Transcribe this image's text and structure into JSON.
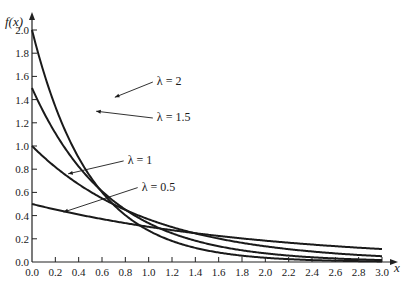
{
  "chart_data": {
    "type": "line",
    "title": "",
    "xlabel": "x",
    "ylabel": "f(x)",
    "xlim": [
      0.0,
      3.0
    ],
    "ylim": [
      0.0,
      2.0
    ],
    "grid": false,
    "legend_position": "inline-annotations",
    "x_ticks": [
      "0.0",
      "0.2",
      "0.4",
      "0.6",
      "0.8",
      "1.0",
      "1.2",
      "1.4",
      "1.6",
      "1.8",
      "2.0",
      "2.2",
      "2.4",
      "2.6",
      "2.8",
      "3.0"
    ],
    "y_ticks": [
      "0.0",
      "0.2",
      "0.4",
      "0.6",
      "0.8",
      "1.0",
      "1.2",
      "1.4",
      "1.6",
      "1.8",
      "2.0"
    ],
    "function": "f(x) = λ·e^(−λx)",
    "series": [
      {
        "name": "λ = 2",
        "lambda": 2.0,
        "x": [
          0,
          0.2,
          0.4,
          0.6,
          0.8,
          1.0,
          1.2,
          1.4,
          1.6,
          1.8,
          2.0,
          2.2,
          2.4,
          2.6,
          2.8,
          3.0
        ],
        "values": [
          2.0,
          1.341,
          0.899,
          0.602,
          0.404,
          0.271,
          0.181,
          0.122,
          0.082,
          0.055,
          0.037,
          0.025,
          0.016,
          0.011,
          0.007,
          0.005
        ],
        "label_pos": [
          0.71,
          1.42
        ],
        "label_text_pos": [
          1.07,
          1.56
        ]
      },
      {
        "name": "λ = 1.5",
        "lambda": 1.5,
        "x": [
          0,
          0.2,
          0.4,
          0.6,
          0.8,
          1.0,
          1.2,
          1.4,
          1.6,
          1.8,
          2.0,
          2.2,
          2.4,
          2.6,
          2.8,
          3.0
        ],
        "values": [
          1.5,
          1.111,
          0.823,
          0.61,
          0.452,
          0.335,
          0.248,
          0.184,
          0.136,
          0.101,
          0.075,
          0.055,
          0.041,
          0.03,
          0.022,
          0.017
        ],
        "label_pos": [
          0.55,
          1.3
        ],
        "label_text_pos": [
          1.07,
          1.25
        ]
      },
      {
        "name": "λ = 1",
        "lambda": 1.0,
        "x": [
          0,
          0.2,
          0.4,
          0.6,
          0.8,
          1.0,
          1.2,
          1.4,
          1.6,
          1.8,
          2.0,
          2.2,
          2.4,
          2.6,
          2.8,
          3.0
        ],
        "values": [
          1.0,
          0.819,
          0.67,
          0.549,
          0.449,
          0.368,
          0.301,
          0.247,
          0.202,
          0.165,
          0.135,
          0.111,
          0.091,
          0.074,
          0.061,
          0.05
        ],
        "label_pos": [
          0.31,
          0.76
        ],
        "label_text_pos": [
          0.82,
          0.88
        ]
      },
      {
        "name": "λ = 0.5",
        "lambda": 0.5,
        "x": [
          0,
          0.2,
          0.4,
          0.6,
          0.8,
          1.0,
          1.2,
          1.4,
          1.6,
          1.8,
          2.0,
          2.2,
          2.4,
          2.6,
          2.8,
          3.0
        ],
        "values": [
          0.5,
          0.452,
          0.409,
          0.37,
          0.335,
          0.303,
          0.274,
          0.248,
          0.225,
          0.203,
          0.184,
          0.166,
          0.151,
          0.136,
          0.123,
          0.112
        ],
        "label_pos": [
          0.27,
          0.43
        ],
        "label_text_pos": [
          0.94,
          0.65
        ]
      }
    ]
  },
  "style": {
    "line_color": "#1a1a1a",
    "axis_color": "#222222",
    "background": "#ffffff"
  }
}
